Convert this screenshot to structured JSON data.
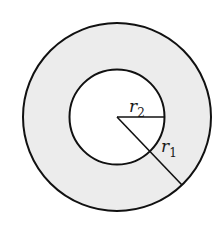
{
  "diagram": {
    "type": "annulus",
    "center": [
      117,
      117
    ],
    "outer_circle": {
      "radius": 94,
      "label": "r",
      "subscript": "1"
    },
    "inner_circle": {
      "radius": 48,
      "label": "r",
      "subscript": "2"
    },
    "colors": {
      "ring_fill": "#ececec",
      "inner_fill": "#ffffff",
      "stroke": "#111111"
    }
  }
}
